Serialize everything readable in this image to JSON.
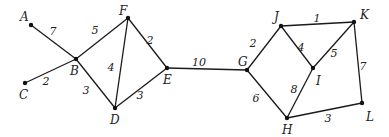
{
  "diagram": {
    "type": "weighted-undirected-graph",
    "nodes": [
      {
        "id": "A",
        "x": 31,
        "y": 25,
        "lx": 20,
        "ly": 21
      },
      {
        "id": "B",
        "x": 76,
        "y": 59,
        "lx": 70,
        "ly": 75
      },
      {
        "id": "C",
        "x": 25,
        "y": 83,
        "lx": 19,
        "ly": 99
      },
      {
        "id": "F",
        "x": 128,
        "y": 18,
        "lx": 119,
        "ly": 15
      },
      {
        "id": "D",
        "x": 115,
        "y": 108,
        "lx": 110,
        "ly": 124
      },
      {
        "id": "E",
        "x": 167,
        "y": 68,
        "lx": 163,
        "ly": 84
      },
      {
        "id": "G",
        "x": 247,
        "y": 70,
        "lx": 238,
        "ly": 66
      },
      {
        "id": "J",
        "x": 281,
        "y": 26,
        "lx": 274,
        "ly": 21
      },
      {
        "id": "K",
        "x": 354,
        "y": 22,
        "lx": 360,
        "ly": 19
      },
      {
        "id": "I",
        "x": 313,
        "y": 68,
        "lx": 316,
        "ly": 85
      },
      {
        "id": "L",
        "x": 362,
        "y": 103,
        "lx": 366,
        "ly": 121
      },
      {
        "id": "H",
        "x": 287,
        "y": 118,
        "lx": 282,
        "ly": 134
      }
    ],
    "edges": [
      {
        "from": "A",
        "to": "B",
        "weight": "7",
        "wx": 53,
        "wy": 35
      },
      {
        "from": "C",
        "to": "B",
        "weight": "2",
        "wx": 46,
        "wy": 85
      },
      {
        "from": "B",
        "to": "F",
        "weight": "5",
        "wx": 95,
        "wy": 34
      },
      {
        "from": "B",
        "to": "D",
        "weight": "3",
        "wx": 86,
        "wy": 94
      },
      {
        "from": "F",
        "to": "D",
        "weight": "4",
        "wx": 111,
        "wy": 71
      },
      {
        "from": "F",
        "to": "E",
        "weight": "2",
        "wx": 150,
        "wy": 44
      },
      {
        "from": "D",
        "to": "E",
        "weight": "3",
        "wx": 140,
        "wy": 99
      },
      {
        "from": "E",
        "to": "G",
        "weight": "10",
        "wx": 199,
        "wy": 66
      },
      {
        "from": "G",
        "to": "J",
        "weight": "2",
        "wx": 253,
        "wy": 47
      },
      {
        "from": "G",
        "to": "H",
        "weight": "6",
        "wx": 256,
        "wy": 102
      },
      {
        "from": "J",
        "to": "K",
        "weight": "1",
        "wx": 317,
        "wy": 22
      },
      {
        "from": "J",
        "to": "I",
        "weight": "4",
        "wx": 301,
        "wy": 51
      },
      {
        "from": "K",
        "to": "I",
        "weight": "5",
        "wx": 334,
        "wy": 57
      },
      {
        "from": "I",
        "to": "H",
        "weight": "8",
        "wx": 294,
        "wy": 93
      },
      {
        "from": "K",
        "to": "L",
        "weight": "7",
        "wx": 363,
        "wy": 70
      },
      {
        "from": "H",
        "to": "L",
        "weight": "3",
        "wx": 328,
        "wy": 122
      }
    ]
  }
}
